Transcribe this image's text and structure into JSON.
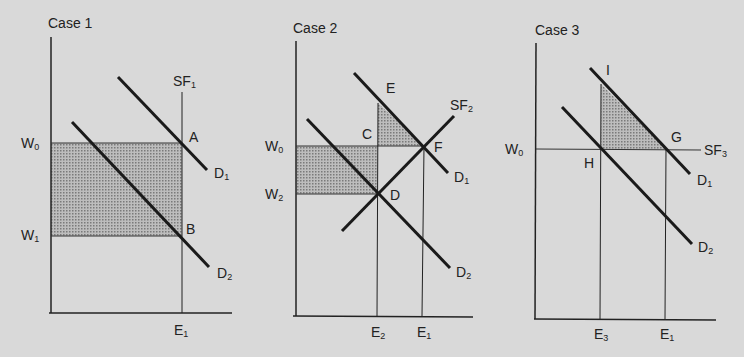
{
  "colors": {
    "background": "#d9d9d9",
    "ink": "#222222",
    "shade": "#a8a8a8"
  },
  "panels": [
    {
      "title": "Case 1",
      "labels": {
        "supply": "SF",
        "supply_sub": "1",
        "wage_high": "W",
        "wage_high_sub": "0",
        "wage_low": "W",
        "wage_low_sub": "1",
        "point_a": "A",
        "point_b": "B",
        "demand1": "D",
        "demand1_sub": "1",
        "demand2": "D",
        "demand2_sub": "2",
        "emp": "E",
        "emp_sub": "1"
      }
    },
    {
      "title": "Case 2",
      "labels": {
        "supply": "SF",
        "supply_sub": "2",
        "wage_high": "W",
        "wage_high_sub": "0",
        "wage_low": "W",
        "wage_low_sub": "2",
        "point_c": "C",
        "point_d": "D",
        "point_e": "E",
        "point_f": "F",
        "demand1": "D",
        "demand1_sub": "1",
        "demand2": "D",
        "demand2_sub": "2",
        "emp2": "E",
        "emp2_sub": "2",
        "emp1": "E",
        "emp1_sub": "1"
      }
    },
    {
      "title": "Case 3",
      "labels": {
        "supply": "SF",
        "supply_sub": "3",
        "wage_high": "W",
        "wage_high_sub": "0",
        "point_g": "G",
        "point_h": "H",
        "point_i": "I",
        "demand1": "D",
        "demand1_sub": "1",
        "demand2": "D",
        "demand2_sub": "2",
        "emp3": "E",
        "emp3_sub": "3",
        "emp1": "E",
        "emp1_sub": "1"
      }
    }
  ]
}
